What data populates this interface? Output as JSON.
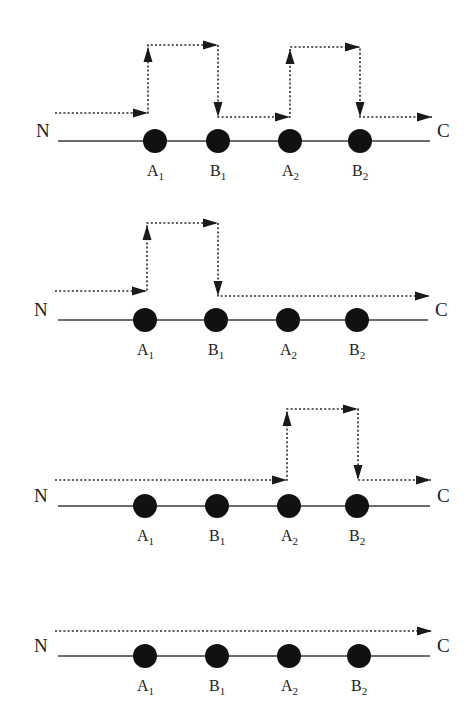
{
  "diagram": {
    "end_labels": {
      "start": "N",
      "end": "C"
    },
    "nodes": [
      {
        "name": "A",
        "sub": "1"
      },
      {
        "name": "B",
        "sub": "1"
      },
      {
        "name": "A",
        "sub": "2"
      },
      {
        "name": "B",
        "sub": "2"
      }
    ],
    "colors": {
      "line": "#3a3a3a",
      "node": "#111111",
      "background": "#ffffff"
    },
    "panels": [
      {
        "id": "panel-1",
        "caption": "detour over A1-B1 and A2-B2",
        "baseline_y": 141,
        "axis_x": [
          58,
          430
        ],
        "node_x": [
          155,
          218,
          290,
          360
        ],
        "label_y": 176,
        "N": [
          36,
          137
        ],
        "C": [
          437,
          137
        ],
        "path": [
          [
            55,
            113
          ],
          [
            148,
            113
          ],
          [
            148,
            45
          ],
          [
            218,
            45
          ],
          [
            218,
            117
          ],
          [
            290,
            117
          ],
          [
            290,
            47
          ],
          [
            360,
            47
          ],
          [
            360,
            117
          ],
          [
            432,
            117
          ]
        ],
        "arrows": [
          {
            "x": 148,
            "y": 113,
            "dir": "right"
          },
          {
            "x": 148,
            "y": 47,
            "dir": "up"
          },
          {
            "x": 218,
            "y": 45,
            "dir": "right"
          },
          {
            "x": 218,
            "y": 117,
            "dir": "down"
          },
          {
            "x": 290,
            "y": 117,
            "dir": "right"
          },
          {
            "x": 290,
            "y": 49,
            "dir": "up"
          },
          {
            "x": 360,
            "y": 47,
            "dir": "right"
          },
          {
            "x": 360,
            "y": 117,
            "dir": "down"
          },
          {
            "x": 432,
            "y": 117,
            "dir": "right"
          }
        ]
      },
      {
        "id": "panel-2",
        "caption": "detour over A1-B1 only",
        "baseline_y": 320,
        "axis_x": [
          58,
          428
        ],
        "node_x": [
          145,
          216,
          288,
          357
        ],
        "label_y": 355,
        "N": [
          34,
          316
        ],
        "C": [
          435,
          316
        ],
        "path": [
          [
            55,
            291
          ],
          [
            147,
            291
          ],
          [
            147,
            223
          ],
          [
            218,
            223
          ],
          [
            218,
            296
          ],
          [
            430,
            296
          ]
        ],
        "arrows": [
          {
            "x": 147,
            "y": 291,
            "dir": "right"
          },
          {
            "x": 147,
            "y": 225,
            "dir": "up"
          },
          {
            "x": 218,
            "y": 223,
            "dir": "right"
          },
          {
            "x": 218,
            "y": 296,
            "dir": "down"
          },
          {
            "x": 430,
            "y": 296,
            "dir": "right"
          }
        ]
      },
      {
        "id": "panel-3",
        "caption": "detour over A2-B2 only",
        "baseline_y": 506,
        "axis_x": [
          58,
          430
        ],
        "node_x": [
          145,
          217,
          289,
          357
        ],
        "label_y": 541,
        "N": [
          34,
          502
        ],
        "C": [
          437,
          502
        ],
        "path": [
          [
            55,
            480
          ],
          [
            287,
            480
          ],
          [
            287,
            409
          ],
          [
            358,
            409
          ],
          [
            358,
            480
          ],
          [
            431,
            480
          ]
        ],
        "arrows": [
          {
            "x": 287,
            "y": 480,
            "dir": "right"
          },
          {
            "x": 287,
            "y": 411,
            "dir": "up"
          },
          {
            "x": 358,
            "y": 409,
            "dir": "right"
          },
          {
            "x": 358,
            "y": 480,
            "dir": "down"
          },
          {
            "x": 431,
            "y": 480,
            "dir": "right"
          }
        ]
      },
      {
        "id": "panel-4",
        "caption": "no detour",
        "baseline_y": 656,
        "axis_x": [
          58,
          430
        ],
        "node_x": [
          145,
          217,
          289,
          359
        ],
        "label_y": 691,
        "N": [
          34,
          652
        ],
        "C": [
          437,
          652
        ],
        "path": [
          [
            55,
            631
          ],
          [
            432,
            631
          ]
        ],
        "arrows": [
          {
            "x": 432,
            "y": 631,
            "dir": "right"
          }
        ]
      }
    ]
  }
}
